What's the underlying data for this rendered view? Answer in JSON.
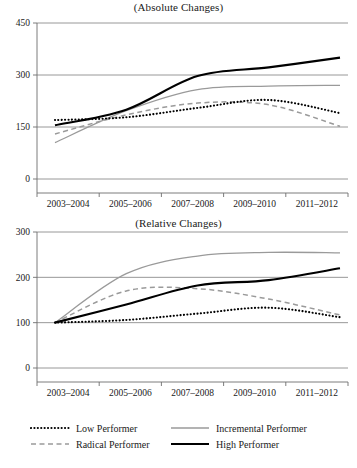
{
  "figure": {
    "width": 357,
    "height": 468
  },
  "legend": {
    "position": "bottom",
    "entries": [
      {
        "label": "Low Performer",
        "style": "dotted",
        "color": "#000000",
        "icon": "dotted-line-icon"
      },
      {
        "label": "Incremental Performer",
        "style": "solid",
        "color": "#9a9a9a",
        "icon": "solid-gray-line-icon"
      },
      {
        "label": "Radical Performer",
        "style": "dashed",
        "color": "#9a9a9a",
        "icon": "dashed-line-icon"
      },
      {
        "label": "High Performer",
        "style": "solid",
        "color": "#000000",
        "icon": "solid-black-line-icon"
      }
    ]
  },
  "chart_data": [
    {
      "type": "line",
      "id": "absolute",
      "title": "(Absolute Changes)",
      "xlabel": "",
      "ylabel": "",
      "grid": true,
      "legend_position": "bottom",
      "categories": [
        "2003–2004",
        "2005–2006",
        "2007–2008",
        "2009–2010",
        "2011–2012"
      ],
      "ylim": [
        0,
        450
      ],
      "yticks": [
        0,
        150,
        300,
        450
      ],
      "series": [
        {
          "name": "Low Performer",
          "style": "dotted",
          "color": "#000000",
          "values": [
            170,
            178,
            205,
            228,
            190
          ]
        },
        {
          "name": "Radical Performer",
          "style": "dashed",
          "color": "#9a9a9a",
          "values": [
            130,
            185,
            219,
            214,
            152
          ]
        },
        {
          "name": "Incremental Performer",
          "style": "solid",
          "color": "#9a9a9a",
          "values": [
            105,
            197,
            258,
            268,
            270
          ]
        },
        {
          "name": "High Performer",
          "style": "solid",
          "color": "#000000",
          "values": [
            155,
            200,
            297,
            322,
            350
          ]
        }
      ]
    },
    {
      "type": "line",
      "id": "relative",
      "title": "(Relative Changes)",
      "xlabel": "",
      "ylabel": "",
      "grid": true,
      "legend_position": "bottom",
      "categories": [
        "2003–2004",
        "2005–2006",
        "2007–2008",
        "2009–2010",
        "2011–2012"
      ],
      "ylim": [
        0,
        300
      ],
      "yticks": [
        0,
        100,
        200,
        300
      ],
      "series": [
        {
          "name": "Low Performer",
          "style": "dotted",
          "color": "#000000",
          "values": [
            100,
            106,
            120,
            133,
            112
          ]
        },
        {
          "name": "Radical Performer",
          "style": "dashed",
          "color": "#9a9a9a",
          "values": [
            100,
            170,
            175,
            152,
            117
          ]
        },
        {
          "name": "Incremental Performer",
          "style": "solid",
          "color": "#9a9a9a",
          "values": [
            100,
            208,
            247,
            255,
            254
          ]
        },
        {
          "name": "High Performer",
          "style": "solid",
          "color": "#000000",
          "values": [
            100,
            140,
            182,
            194,
            220
          ]
        }
      ]
    }
  ]
}
